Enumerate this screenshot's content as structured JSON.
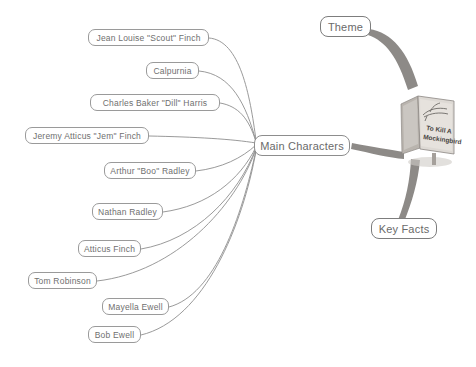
{
  "diagram": {
    "background_color": "#ffffff",
    "node_border_color": "#9a9a9a",
    "node_text_color": "#6f6f6f",
    "branch_color_thin": "#8e8e8e",
    "branch_color_thick": "#7a7a7a"
  },
  "hub": {
    "label": "Main Characters",
    "x": 254,
    "y": 135,
    "width": 96,
    "height": 21
  },
  "side_nodes": [
    {
      "label": "Theme",
      "x": 320,
      "y": 16,
      "width": 51,
      "height": 21
    },
    {
      "label": "Key Facts",
      "x": 371,
      "y": 218,
      "width": 66,
      "height": 21
    }
  ],
  "characters": [
    {
      "label": "Jean Louise \"Scout\" Finch",
      "x": 88,
      "y": 29,
      "width": 121
    },
    {
      "label": "Calpurnia",
      "x": 146,
      "y": 62,
      "width": 53
    },
    {
      "label": "Charles Baker \"Dill\" Harris",
      "x": 90,
      "y": 94,
      "width": 130
    },
    {
      "label": "Jeremy Atticus \"Jem\" Finch",
      "x": 25,
      "y": 127,
      "width": 124
    },
    {
      "label": "Arthur \"Boo\" Radley",
      "x": 104,
      "y": 162,
      "width": 92
    },
    {
      "label": "Nathan Radley",
      "x": 92,
      "y": 203,
      "width": 71
    },
    {
      "label": "Atticus Finch",
      "x": 78,
      "y": 240,
      "width": 63
    },
    {
      "label": "Tom Robinson",
      "x": 28,
      "y": 272,
      "width": 69
    },
    {
      "label": "Mayella Ewell",
      "x": 102,
      "y": 298,
      "width": 67
    },
    {
      "label": "Bob Ewell",
      "x": 88,
      "y": 326,
      "width": 53
    }
  ],
  "book": {
    "title_line_1": "To Kill A",
    "title_line_2": "Mockingbird",
    "cover_color": "#d8d4cf",
    "spine_color": "#9a958f",
    "x": 398,
    "y": 84,
    "width": 62,
    "height": 82
  }
}
